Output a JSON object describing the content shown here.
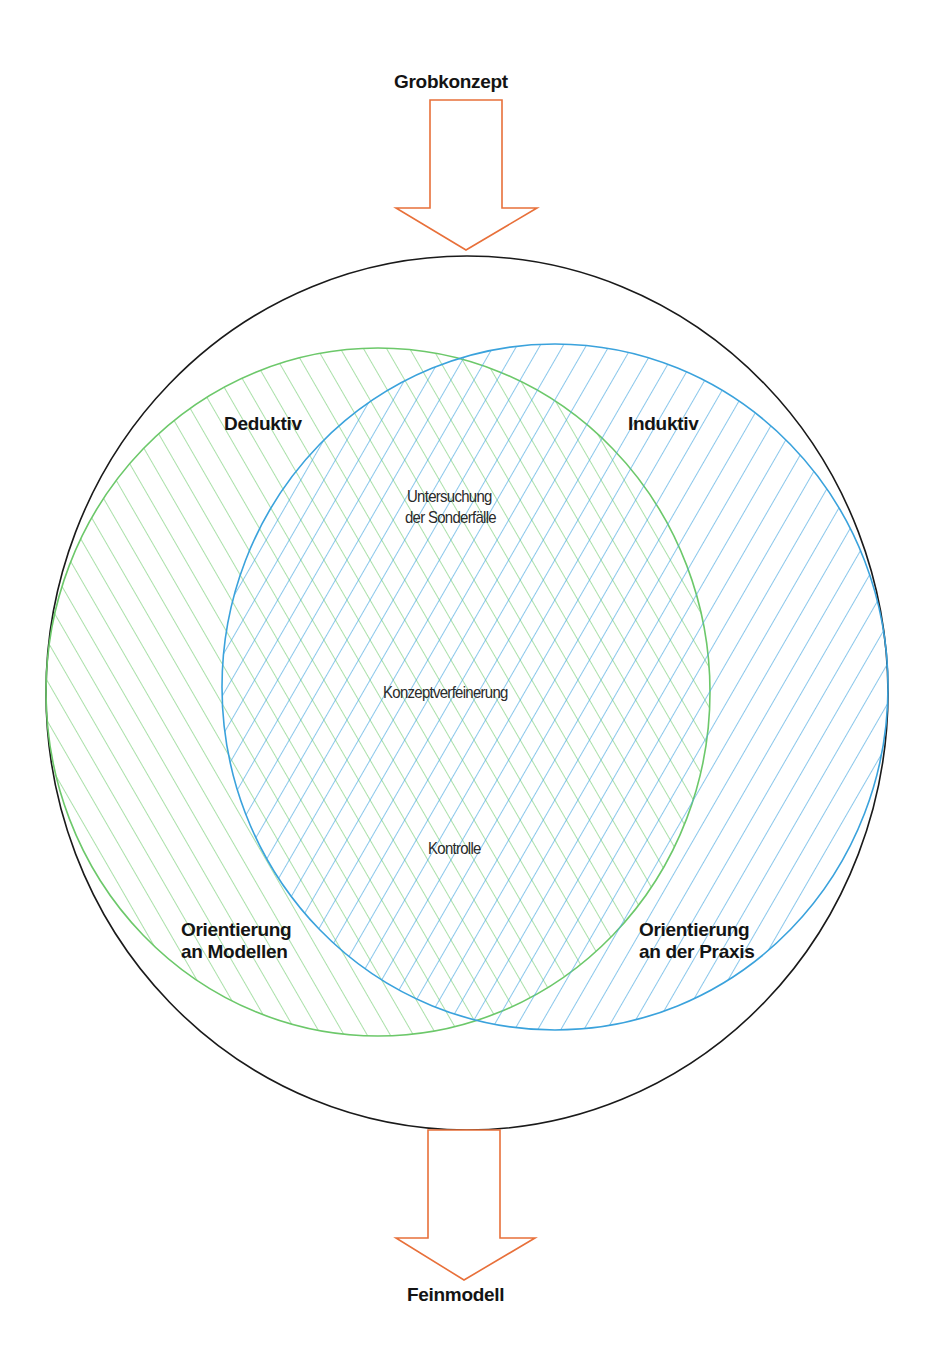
{
  "diagram": {
    "type": "venn-process",
    "input": {
      "label": "Grobkonzept",
      "arrow_color": "#e8703a"
    },
    "output": {
      "label": "Feinmodell",
      "arrow_color": "#e8703a"
    },
    "outer_circle": {
      "stroke": "#1a1a1a"
    },
    "left_set": {
      "label": "Deduktiv",
      "sub_label_line1": "Orientierung",
      "sub_label_line2": "an Modellen",
      "color": "#7ccf7a"
    },
    "right_set": {
      "label": "Induktiv",
      "sub_label_line1": "Orientierung",
      "sub_label_line2": "an der Praxis",
      "color": "#4aa8e0"
    },
    "overlap": {
      "item1_line1": "Untersuchung",
      "item1_line2": "der Sonderfälle",
      "item2": "Konzeptverfeinerung",
      "item3": "Kontrolle"
    }
  }
}
